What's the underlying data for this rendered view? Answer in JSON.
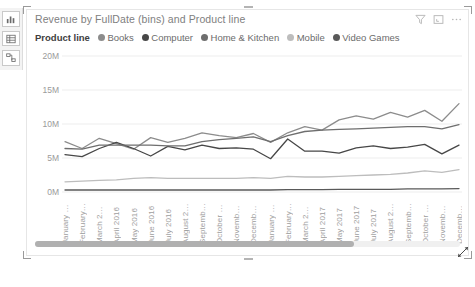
{
  "rail": {
    "items": [
      {
        "name": "report-view",
        "icon": "bar-chart-icon"
      },
      {
        "name": "data-view",
        "icon": "table-icon"
      },
      {
        "name": "model-view",
        "icon": "relationships-icon"
      }
    ]
  },
  "visual": {
    "title": "Revenue by FullDate (bins) and Product line",
    "header_icons": [
      {
        "name": "filter-icon",
        "label": "Filters"
      },
      {
        "name": "focus-mode-icon",
        "label": "Focus mode"
      },
      {
        "name": "more-options-icon",
        "label": "More options"
      }
    ],
    "legend_title": "Product line"
  },
  "scrollbar": {
    "thumb_start_pct": 0,
    "thumb_width_pct": 75
  },
  "chart_data": {
    "type": "line",
    "title": "Revenue by FullDate (bins) and Product line",
    "xlabel": "",
    "ylabel": "",
    "ylim": [
      0,
      20000000
    ],
    "ytick_labels": [
      "0M",
      "5M",
      "10M",
      "15M",
      "20M"
    ],
    "ytick_values": [
      0,
      5000000,
      10000000,
      15000000,
      20000000
    ],
    "grid": true,
    "legend_position": "top",
    "categories": [
      "January 2016",
      "February 20...",
      "March 2016",
      "April 2016",
      "May 2016",
      "June 2016",
      "July 2016",
      "August 2016",
      "September ...",
      "October 20...",
      "November ...",
      "December ...",
      "January 2017",
      "February 20...",
      "March 2017",
      "April 2017",
      "May 2017",
      "June 2017",
      "July 2017",
      "August 2017",
      "September ...",
      "October 20...",
      "November ...",
      "December ..."
    ],
    "series": [
      {
        "name": "Books",
        "color": "#8c8c8c",
        "values": [
          7400000,
          6400000,
          7900000,
          7100000,
          6300000,
          8000000,
          7300000,
          7900000,
          8700000,
          8300000,
          8000000,
          8600000,
          7300000,
          8700000,
          9600000,
          9100000,
          10600000,
          11200000,
          10700000,
          11700000,
          11000000,
          12000000,
          10400000,
          13000000
        ]
      },
      {
        "name": "Computer",
        "color": "#474747",
        "values": [
          5500000,
          5200000,
          6400000,
          7300000,
          6400000,
          5300000,
          6700000,
          6200000,
          6900000,
          6400000,
          6500000,
          6300000,
          4900000,
          7800000,
          6000000,
          6000000,
          5700000,
          6500000,
          6800000,
          6400000,
          6600000,
          7000000,
          5600000,
          6900000
        ]
      },
      {
        "name": "Home & Kitchen",
        "color": "#6e6e6e",
        "values": [
          6400000,
          6300000,
          6900000,
          6900000,
          6900000,
          6900000,
          6800000,
          6800000,
          7400000,
          7700000,
          7900000,
          8100000,
          7400000,
          8300000,
          8900000,
          9100000,
          9200000,
          9300000,
          9400000,
          9500000,
          9600000,
          9600000,
          9300000,
          9900000
        ]
      },
      {
        "name": "Mobile",
        "color": "#bdbdbd",
        "values": [
          1500000,
          1600000,
          1700000,
          1800000,
          2000000,
          2100000,
          2000000,
          2000000,
          2000000,
          2000000,
          2000000,
          2100000,
          2000000,
          2300000,
          2200000,
          2200000,
          2300000,
          2400000,
          2500000,
          2600000,
          2800000,
          3100000,
          2900000,
          3300000
        ]
      },
      {
        "name": "Video Games",
        "color": "#595959",
        "values": [
          300000,
          300000,
          300000,
          300000,
          300000,
          300000,
          300000,
          300000,
          300000,
          300000,
          300000,
          300000,
          300000,
          350000,
          350000,
          350000,
          400000,
          400000,
          400000,
          400000,
          450000,
          450000,
          450000,
          500000
        ]
      }
    ]
  }
}
